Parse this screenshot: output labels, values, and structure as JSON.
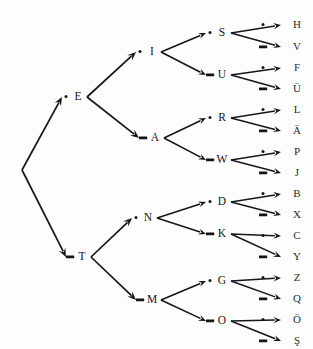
{
  "diagram": {
    "type": "binary-tree",
    "background_color": "#fdfdfd",
    "ink_color": "#16161a",
    "symbols": {
      "dot_label": "·",
      "dash_label": "–",
      "dot_name": "dot",
      "dash_name": "dash"
    },
    "root": {
      "label": "",
      "x": 22,
      "y": 170
    },
    "levels": [
      {
        "index": 1,
        "nodes": [
          {
            "letter": "E",
            "symbol": "dot",
            "code": ".",
            "x": 78,
            "y": 97
          },
          {
            "letter": "T",
            "symbol": "dash",
            "code": "-",
            "x": 82,
            "y": 257
          }
        ]
      },
      {
        "index": 2,
        "nodes": [
          {
            "letter": "I",
            "symbol": "dot",
            "code": "..",
            "x": 152,
            "y": 52,
            "parent": "E"
          },
          {
            "letter": "A",
            "symbol": "dash",
            "code": ".-",
            "x": 155,
            "y": 138,
            "parent": "E"
          },
          {
            "letter": "N",
            "symbol": "dot",
            "code": "-.",
            "x": 148,
            "y": 218,
            "parent": "T"
          },
          {
            "letter": "M",
            "symbol": "dash",
            "code": "--",
            "x": 152,
            "y": 300,
            "parent": "T"
          }
        ]
      },
      {
        "index": 3,
        "nodes": [
          {
            "letter": "S",
            "symbol": "dot",
            "code": "...",
            "x": 222,
            "y": 33,
            "parent": "I"
          },
          {
            "letter": "U",
            "symbol": "dash",
            "code": "..-",
            "x": 222,
            "y": 75,
            "parent": "I"
          },
          {
            "letter": "R",
            "symbol": "dot",
            "code": ".-.",
            "x": 222,
            "y": 118,
            "parent": "A"
          },
          {
            "letter": "W",
            "symbol": "dash",
            "code": ".--",
            "x": 222,
            "y": 160,
            "parent": "A"
          },
          {
            "letter": "D",
            "symbol": "dot",
            "code": "-..",
            "x": 222,
            "y": 202,
            "parent": "N"
          },
          {
            "letter": "K",
            "symbol": "dash",
            "code": "-.-",
            "x": 222,
            "y": 234,
            "parent": "N"
          },
          {
            "letter": "G",
            "symbol": "dot",
            "code": "--.",
            "x": 222,
            "y": 281,
            "parent": "M"
          },
          {
            "letter": "O",
            "symbol": "dash",
            "code": "---",
            "x": 222,
            "y": 321,
            "parent": "M"
          }
        ]
      },
      {
        "index": 4,
        "nodes": [
          {
            "letter": "H",
            "symbol": "dot",
            "code": "....",
            "x": 297,
            "y": 25,
            "parent": "S"
          },
          {
            "letter": "V",
            "symbol": "dash",
            "code": "...-",
            "x": 297,
            "y": 47,
            "parent": "S"
          },
          {
            "letter": "F",
            "symbol": "dot",
            "code": "..-.",
            "x": 297,
            "y": 68,
            "parent": "U"
          },
          {
            "letter": "Ü",
            "symbol": "dash",
            "code": "..--",
            "x": 297,
            "y": 89,
            "parent": "U"
          },
          {
            "letter": "L",
            "symbol": "dot",
            "code": ".-..",
            "x": 297,
            "y": 110,
            "parent": "R"
          },
          {
            "letter": "Ä",
            "symbol": "dash",
            "code": ".-.-",
            "x": 297,
            "y": 131,
            "parent": "R"
          },
          {
            "letter": "P",
            "symbol": "dot",
            "code": ".--.",
            "x": 297,
            "y": 152,
            "parent": "W"
          },
          {
            "letter": "J",
            "symbol": "dash",
            "code": ".---",
            "x": 297,
            "y": 173,
            "parent": "W"
          },
          {
            "letter": "B",
            "symbol": "dot",
            "code": "-...",
            "x": 297,
            "y": 194,
            "parent": "D"
          },
          {
            "letter": "X",
            "symbol": "dash",
            "code": "-..-",
            "x": 297,
            "y": 215,
            "parent": "D"
          },
          {
            "letter": "C",
            "symbol": "dot",
            "code": "-.-.",
            "x": 297,
            "y": 236,
            "parent": "K"
          },
          {
            "letter": "Y",
            "symbol": "dash",
            "code": "-.--",
            "x": 297,
            "y": 257,
            "parent": "K"
          },
          {
            "letter": "Z",
            "symbol": "dot",
            "code": "--..",
            "x": 297,
            "y": 278,
            "parent": "G"
          },
          {
            "letter": "Q",
            "symbol": "dash",
            "code": "--.-",
            "x": 297,
            "y": 299,
            "parent": "G"
          },
          {
            "letter": "Ö",
            "symbol": "dot",
            "code": "---.",
            "x": 297,
            "y": 320,
            "parent": "O"
          },
          {
            "letter": "Ş",
            "symbol": "dash",
            "code": "----",
            "x": 297,
            "y": 341,
            "parent": "O"
          }
        ]
      }
    ]
  }
}
